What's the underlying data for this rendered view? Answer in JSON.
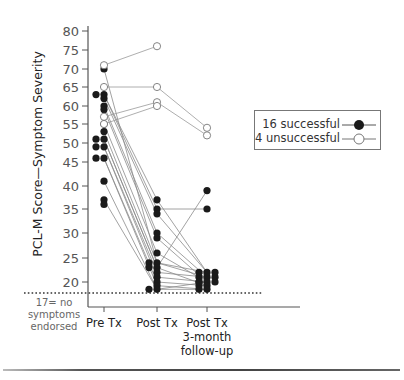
{
  "chart_data": {
    "type": "line",
    "title": "",
    "xlabel": "",
    "ylabel": "PCL-M Score—Symptom Severity",
    "categories": [
      "Pre Tx",
      "Post Tx",
      "Post Tx 3-month follow-up"
    ],
    "category_lines": [
      [
        "Pre Tx"
      ],
      [
        "Post Tx"
      ],
      [
        "Post Tx",
        "3-month",
        "follow-up"
      ]
    ],
    "yticks": [
      20,
      25,
      30,
      35,
      40,
      45,
      50,
      55,
      60,
      65,
      70,
      75,
      80
    ],
    "ylim": [
      17,
      80
    ],
    "reference_line": {
      "value": 17,
      "label_lines": [
        "17= no",
        "symptoms",
        "endorsed"
      ],
      "style": "dotted"
    },
    "legend_position": "right",
    "series": [
      {
        "name": "16 successful",
        "marker": "filled",
        "subjects": [
          [
            70,
            24,
            21
          ],
          [
            63,
            37,
            22
          ],
          [
            63,
            35,
            35
          ],
          [
            62,
            34,
            22
          ],
          [
            60,
            30,
            21
          ],
          [
            59,
            29,
            20
          ],
          [
            55,
            26,
            20
          ],
          [
            53,
            24,
            22
          ],
          [
            51,
            23,
            39
          ],
          [
            51,
            23,
            19
          ],
          [
            49,
            22,
            21
          ],
          [
            49,
            21,
            20
          ],
          [
            46,
            20,
            19
          ],
          [
            46,
            19,
            18
          ],
          [
            41,
            18,
            20
          ],
          [
            37,
            18,
            18
          ]
        ]
      },
      {
        "name": "4 unsuccessful",
        "marker": "open",
        "subjects": [
          [
            71,
            76,
            null
          ],
          [
            65,
            65,
            54
          ],
          [
            57,
            61,
            52
          ],
          [
            55,
            60,
            null
          ]
        ]
      }
    ],
    "extra_points_pre": [
      36
    ]
  },
  "legend": {
    "items": [
      {
        "label": "16 successful",
        "marker": "filled"
      },
      {
        "label": "4 unsuccessful",
        "marker": "open"
      }
    ]
  },
  "colors": {
    "filled": "#1a1a1a",
    "line": "#888888",
    "axis": "#555555"
  }
}
